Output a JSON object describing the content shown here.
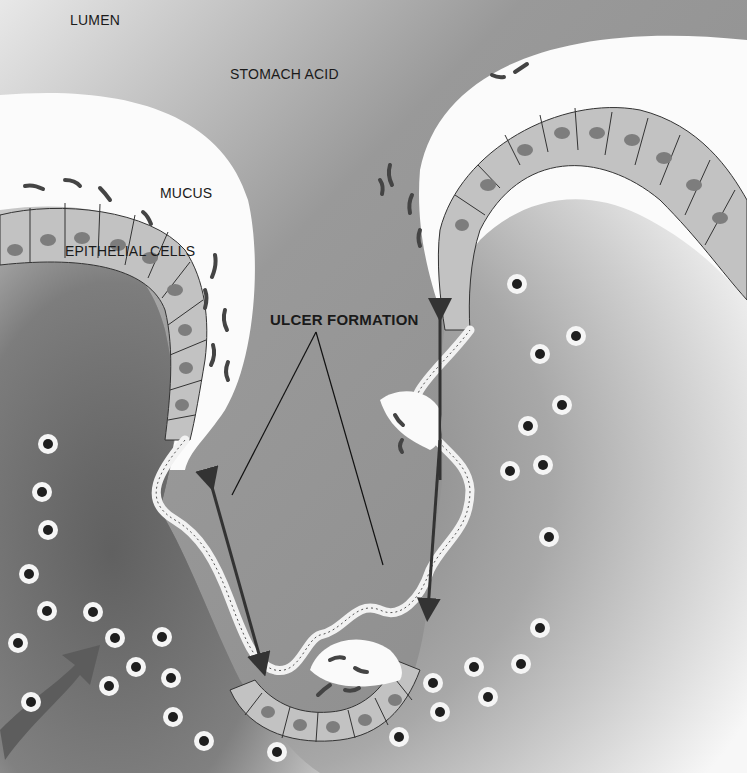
{
  "diagram": {
    "colors": {
      "lumen": "#8f8f8f",
      "mucus": "#fafafa",
      "tissue": "#6f6f6f",
      "cell": "#bdbdbd",
      "nucleus": "#7a7a7a",
      "bacteria": "#4a4a4a",
      "arrow": "#3a3a3a",
      "white_blood_cell_ring": "#f4f4f4",
      "white_blood_cell_nucleus": "#1e1e1e"
    },
    "labels": {
      "lumen": "LUMEN",
      "stomach_acid": "STOMACH ACID",
      "mucus": "MUCUS",
      "epithelial_cells": "EPITHELIAL CELLS",
      "ulcer_formation": "ULCER FORMATION"
    },
    "elements": [
      {
        "name": "lumen",
        "description": "Stomach cavity filled with acid (gray region, top)"
      },
      {
        "name": "mucus-layer-left",
        "description": "White mucus layer over left epithelial fold"
      },
      {
        "name": "mucus-layer-right",
        "description": "White mucus layer over right epithelial fold"
      },
      {
        "name": "epithelial-cell-layer",
        "description": "Row of epithelial cells with nuclei and cilia"
      },
      {
        "name": "bacteria",
        "description": "Curved rod-shaped bacteria (H. pylori) in mucus"
      },
      {
        "name": "ulcer-crater",
        "description": "Eroded crater descending into the tissue"
      },
      {
        "name": "erosion-arrows",
        "description": "Double-headed arrows showing ulcer expansion"
      },
      {
        "name": "white-blood-cells",
        "description": "Neutrophils migrating toward the ulcer"
      },
      {
        "name": "inflammatory-arrow",
        "description": "Large arrow bottom-left indicating immune cell influx"
      }
    ]
  }
}
